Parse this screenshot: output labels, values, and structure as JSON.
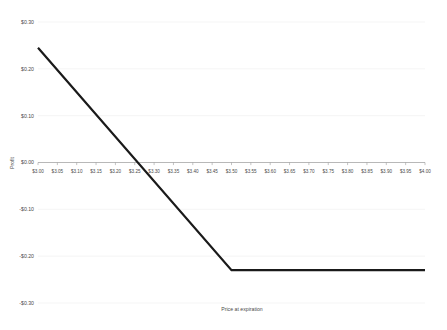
{
  "chart_data": {
    "type": "line",
    "title": "",
    "xlabel": "Price at expiration",
    "ylabel": "Profit",
    "xlim": [
      3.0,
      4.0
    ],
    "ylim": [
      -0.3,
      0.3
    ],
    "grid": true,
    "legend": "none",
    "x_tick_labels": [
      "$3.00",
      "$3.05",
      "$3.10",
      "$3.15",
      "$3.20",
      "$3.25",
      "$3.30",
      "$3.35",
      "$3.40",
      "$3.45",
      "$3.50",
      "$3.55",
      "$3.60",
      "$3.65",
      "$3.70",
      "$3.75",
      "$3.80",
      "$3.85",
      "$3.90",
      "$3.95",
      "$4.00"
    ],
    "x_tick_values": [
      3.0,
      3.05,
      3.1,
      3.15,
      3.2,
      3.25,
      3.3,
      3.35,
      3.4,
      3.45,
      3.5,
      3.55,
      3.6,
      3.65,
      3.7,
      3.75,
      3.8,
      3.85,
      3.9,
      3.95,
      4.0
    ],
    "y_tick_labels": [
      "$0.30",
      "$0.20",
      "$0.10",
      "$0.00",
      "-$0.10",
      "-$0.20",
      "-$0.30"
    ],
    "y_tick_values": [
      0.3,
      0.2,
      0.1,
      0.0,
      -0.1,
      -0.2,
      -0.3
    ],
    "series": [
      {
        "name": "Profit at expiration",
        "x": [
          3.0,
          3.5,
          4.0
        ],
        "values": [
          0.245,
          -0.23,
          -0.23
        ]
      }
    ],
    "annotations": {
      "breakeven_x": 3.245,
      "breakeven_y": 0.0,
      "kink_x": 3.5,
      "kink_y": -0.23
    }
  }
}
